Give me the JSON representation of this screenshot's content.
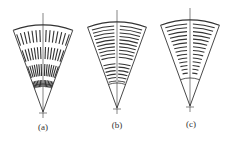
{
  "figure": {
    "stroke_color": "#333333",
    "panels": [
      {
        "id": "a",
        "label": "(a)",
        "apex": [
          43,
          112
        ],
        "radius": 87,
        "half_angle_deg": 20,
        "inner_arc_radius": 28,
        "pattern": "radial-dashes",
        "label_pos": [
          43,
          122
        ]
      },
      {
        "id": "b",
        "label": "(b)",
        "apex": [
          117,
          108
        ],
        "radius": 86,
        "half_angle_deg": 20,
        "inner_arc_radius": 25,
        "pattern": "concentric-arcs",
        "label_pos": [
          117,
          120
        ]
      },
      {
        "id": "c",
        "label": "(c)",
        "apex": [
          190,
          106
        ],
        "radius": 86,
        "half_angle_deg": 20,
        "inner_arc_radius": 28,
        "pattern": "concentric-arcs-tapered",
        "label_pos": [
          191,
          119
        ]
      }
    ]
  }
}
